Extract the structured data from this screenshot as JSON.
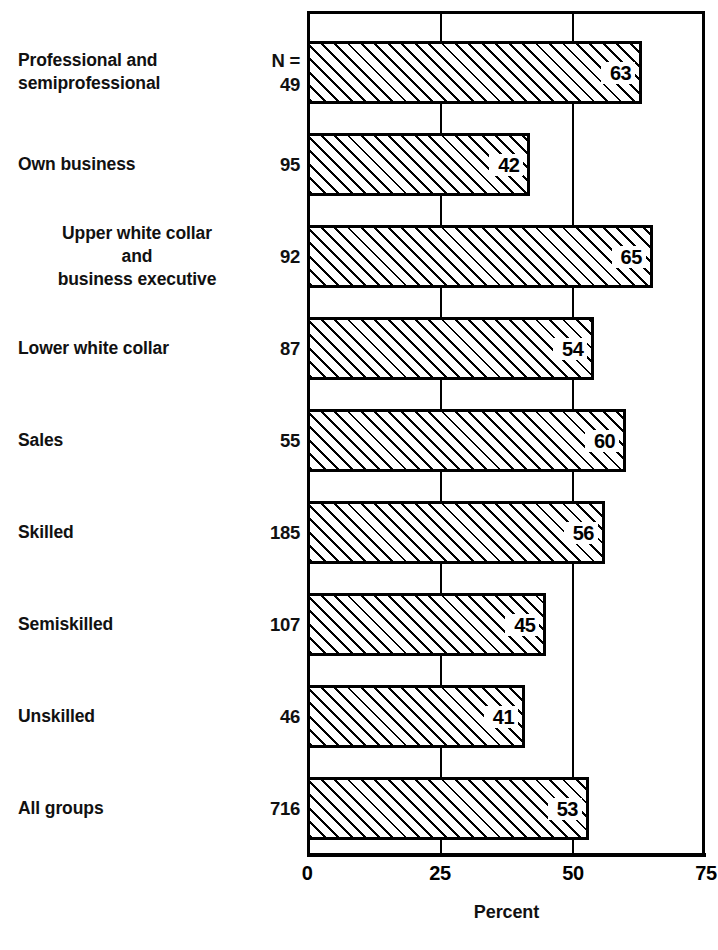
{
  "chart_data": {
    "type": "bar",
    "orientation": "horizontal",
    "title": "",
    "xlabel": "Percent",
    "ylabel": "",
    "xlim": [
      0,
      75
    ],
    "xticks": [
      0,
      25,
      50,
      75
    ],
    "xtick_labels": [
      "0",
      "25",
      "50",
      "75"
    ],
    "grid": true,
    "grid_axis": "x",
    "legend": false,
    "n_header": "N =",
    "categories": [
      "Professional and\nsemiprofessional",
      "Own business",
      "Upper white collar\nand\nbusiness executive",
      "Lower white collar",
      "Sales",
      "Skilled",
      "Semiskilled",
      "Unskilled",
      "All groups"
    ],
    "values": [
      63,
      42,
      65,
      54,
      60,
      56,
      45,
      41,
      53
    ],
    "counts": [
      49,
      95,
      92,
      87,
      55,
      185,
      107,
      46,
      716
    ],
    "bars": [
      {
        "label_line1": "Professional and",
        "label_line2": "semiprofessional",
        "label_line3": "",
        "n": "49",
        "value": 63,
        "value_label": "63"
      },
      {
        "label_line1": "Own business",
        "label_line2": "",
        "label_line3": "",
        "n": "95",
        "value": 42,
        "value_label": "42"
      },
      {
        "label_line1": "Upper white collar",
        "label_line2": "and",
        "label_line3": "business executive",
        "n": "92",
        "value": 65,
        "value_label": "65"
      },
      {
        "label_line1": "Lower white collar",
        "label_line2": "",
        "label_line3": "",
        "n": "87",
        "value": 54,
        "value_label": "54"
      },
      {
        "label_line1": "Sales",
        "label_line2": "",
        "label_line3": "",
        "n": "55",
        "value": 60,
        "value_label": "60"
      },
      {
        "label_line1": "Skilled",
        "label_line2": "",
        "label_line3": "",
        "n": "185",
        "value": 56,
        "value_label": "56"
      },
      {
        "label_line1": "Semiskilled",
        "label_line2": "",
        "label_line3": "",
        "n": "107",
        "value": 45,
        "value_label": "45"
      },
      {
        "label_line1": "Unskilled",
        "label_line2": "",
        "label_line3": "",
        "n": "46",
        "value": 41,
        "value_label": "41"
      },
      {
        "label_line1": "All groups",
        "label_line2": "",
        "label_line3": "",
        "n": "716",
        "value": 53,
        "value_label": "53"
      }
    ],
    "colors": {
      "ink": "#000000",
      "background": "#ffffff",
      "bar_fill": "#ffffff",
      "bar_hatch": "#000000"
    }
  }
}
